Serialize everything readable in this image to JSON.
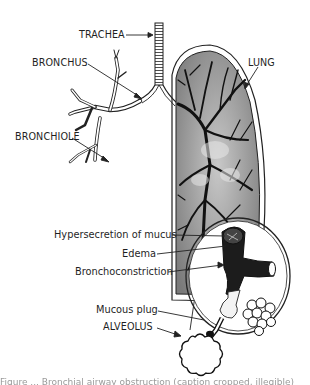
{
  "figure": {
    "type": "medical-illustration"
  },
  "labels": {
    "trachea": "TRACHEA",
    "bronchus": "BRONCHUS",
    "bronchiole": "BRONCHIOLE",
    "lung": "LUNG",
    "hypersecretion": "Hypersecretion of mucus",
    "edema": "Edema",
    "bronchoconstriction": "Bronchoconstriction",
    "mucous_plug": "Mucous plug",
    "alveolus": "ALVEOLUS"
  },
  "caption": {
    "text": "Figure ... Bronchial airway obstruction (caption cropped, illegible)"
  },
  "colors": {
    "ink": "#1a1a1a",
    "lung_fill": "#9c9c9c",
    "background": "#ffffff"
  }
}
